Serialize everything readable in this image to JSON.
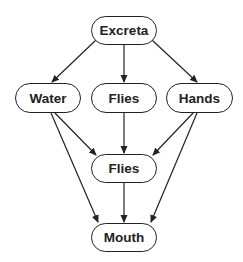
{
  "diagram": {
    "colors": {
      "stroke": "#222222",
      "text": "#222222",
      "background": "#ffffff"
    },
    "nodes": {
      "excreta": {
        "label": "Excreta"
      },
      "water": {
        "label": "Water"
      },
      "flies_top": {
        "label": "Flies"
      },
      "hands": {
        "label": "Hands"
      },
      "flies_mid": {
        "label": "Flies"
      },
      "mouth": {
        "label": "Mouth"
      }
    },
    "edges": [
      {
        "from": "Excreta",
        "to": "Water"
      },
      {
        "from": "Excreta",
        "to": "Flies"
      },
      {
        "from": "Excreta",
        "to": "Hands"
      },
      {
        "from": "Water",
        "to": "Flies"
      },
      {
        "from": "Water",
        "to": "Mouth"
      },
      {
        "from": "Flies",
        "to": "Flies"
      },
      {
        "from": "Hands",
        "to": "Flies"
      },
      {
        "from": "Hands",
        "to": "Mouth"
      },
      {
        "from": "Flies",
        "to": "Mouth"
      }
    ]
  }
}
